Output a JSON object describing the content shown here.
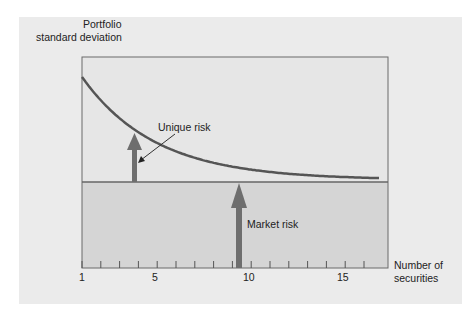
{
  "chart_data": {
    "type": "line",
    "title": "",
    "ylabel": "Portfolio standard deviation",
    "xlabel": "Number of securities",
    "x_ticks": [
      1,
      5,
      10,
      15
    ],
    "x_minor_ticks": [
      1,
      2,
      3,
      4,
      5,
      6,
      7,
      8,
      9,
      10,
      11,
      12,
      13,
      14,
      15,
      16
    ],
    "xlim": [
      1,
      17.3
    ],
    "grid": false,
    "series": [
      {
        "name": "Portfolio standard deviation",
        "x": [
          1,
          2,
          3,
          4,
          5,
          6,
          7,
          8,
          9,
          10,
          11,
          12,
          13,
          14,
          15,
          16,
          17
        ],
        "values": [
          1.0,
          0.82,
          0.68,
          0.56,
          0.46,
          0.37,
          0.29,
          0.22,
          0.16,
          0.11,
          0.08,
          0.06,
          0.04,
          0.03,
          0.02,
          0.02,
          0.02
        ]
      }
    ],
    "market_risk_level": 0,
    "annotations": [
      {
        "text": "Unique risk",
        "arrow_x": 3.8
      },
      {
        "text": "Market risk",
        "arrow_x": 9.5
      }
    ]
  },
  "labels": {
    "ylabel_line1": "Portfolio",
    "ylabel_line2": "standard deviation",
    "xlabel_line1": "Number of",
    "xlabel_line2": "securities",
    "unique_risk": "Unique risk",
    "market_risk": "Market risk",
    "tick_1": "1",
    "tick_5": "5",
    "tick_10": "10",
    "tick_15": "15"
  },
  "colors": {
    "panel": "#ebebeb",
    "plot_upper": "#e4e4e4",
    "plot_lower": "#d6d6d6",
    "curve": "#555555",
    "arrow": "#6a6a6a",
    "axis": "#666666"
  }
}
